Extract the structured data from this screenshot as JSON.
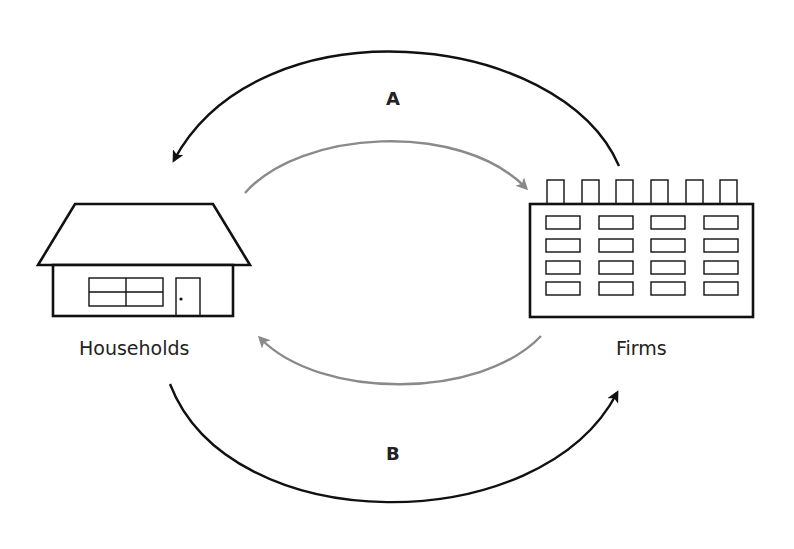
{
  "diagram": {
    "type": "circular-flow",
    "nodes": {
      "households": {
        "label": "Households",
        "icon": "house-icon"
      },
      "firms": {
        "label": "Firms",
        "icon": "factory-building-icon"
      }
    },
    "flows": {
      "outer_top": {
        "label": "A",
        "from": "Firms",
        "to": "Households",
        "color": "#111111"
      },
      "inner_top": {
        "label": "",
        "from": "Households",
        "to": "Firms",
        "color": "#8a8a8a"
      },
      "inner_bottom": {
        "label": "",
        "from": "Firms",
        "to": "Households",
        "color": "#8a8a8a"
      },
      "outer_bottom": {
        "label": "B",
        "from": "Households",
        "to": "Firms",
        "color": "#111111"
      }
    }
  }
}
